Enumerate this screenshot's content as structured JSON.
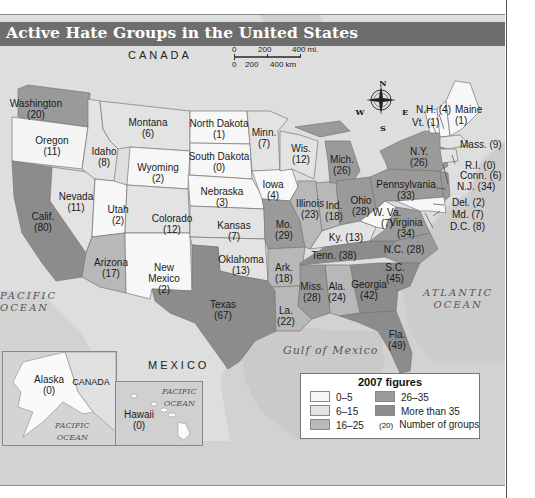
{
  "title": "Active Hate Groups in the United States",
  "scale": {
    "mi": [
      "0",
      "200",
      "400 mi."
    ],
    "km": [
      "0",
      "200",
      "400 km"
    ]
  },
  "compass": {
    "n": "N",
    "s": "S",
    "e": "E",
    "w": "W"
  },
  "labels": {
    "canada_top": "CANADA",
    "mexico": "MEXICO",
    "pacific_left": [
      "PACIFIC",
      "OCEAN"
    ],
    "atlantic": [
      "ATLANTIC",
      "OCEAN"
    ],
    "gulf": "Gulf of Mexico",
    "inset_canada": "CANADA",
    "inset_ak_pacific": [
      "PACIFIC",
      "OCEAN"
    ],
    "inset_hi_pacific": [
      "PACIFIC",
      "OCEAN"
    ]
  },
  "colors": {
    "c0_5": "#f7f7f7",
    "c6_15": "#e3e3e3",
    "c16_25": "#b8b8b8",
    "c26_35": "#9a9a9a",
    "c35plus": "#8c8c8c",
    "land": "#dcdcdc",
    "water": "#cfcfcf",
    "title_bar": "#6e6e6e"
  },
  "legend": {
    "title": "2007 figures",
    "items": [
      {
        "label": "0–5",
        "bin": "c0_5"
      },
      {
        "label": "6–15",
        "bin": "c6_15"
      },
      {
        "label": "16–25",
        "bin": "c16_25"
      },
      {
        "label": "26–35",
        "bin": "c26_35"
      },
      {
        "label": "More than 35",
        "bin": "c35plus"
      }
    ],
    "sample_count": "(20)",
    "sample_label": "Number of groups"
  },
  "chart_data": {
    "type": "choropleth",
    "title": "Active Hate Groups in the United States",
    "subtitle": "2007 figures",
    "legend_bins": [
      "0–5",
      "6–15",
      "16–25",
      "26–35",
      "More than 35"
    ],
    "states": [
      {
        "name": "Washington",
        "value": 20
      },
      {
        "name": "Oregon",
        "value": 11
      },
      {
        "name": "Idaho",
        "value": 8
      },
      {
        "name": "Montana",
        "value": 6
      },
      {
        "name": "Wyoming",
        "value": 2
      },
      {
        "name": "North Dakota",
        "value": 1
      },
      {
        "name": "South Dakota",
        "value": 0
      },
      {
        "name": "Nebraska",
        "value": 3
      },
      {
        "name": "Minn.",
        "value": 7
      },
      {
        "name": "Wis.",
        "value": 12
      },
      {
        "name": "Iowa",
        "value": 4
      },
      {
        "name": "Mich.",
        "value": 26
      },
      {
        "name": "Illinois",
        "value": 23
      },
      {
        "name": "Ind.",
        "value": 18
      },
      {
        "name": "Ohio",
        "value": 28
      },
      {
        "name": "N.Y.",
        "value": 26
      },
      {
        "name": "Pennsylvania",
        "value": 33
      },
      {
        "name": "Maine",
        "value": 1
      },
      {
        "name": "N.H.",
        "value": 4
      },
      {
        "name": "Vt.",
        "value": 1
      },
      {
        "name": "Mass.",
        "value": 9
      },
      {
        "name": "R.I.",
        "value": 0
      },
      {
        "name": "Conn.",
        "value": 6
      },
      {
        "name": "N.J.",
        "value": 34
      },
      {
        "name": "Del.",
        "value": 2
      },
      {
        "name": "Md.",
        "value": 7
      },
      {
        "name": "D.C.",
        "value": 8
      },
      {
        "name": "W. Va.",
        "value": 7
      },
      {
        "name": "Virginia",
        "value": 34
      },
      {
        "name": "Ky.",
        "value": 13
      },
      {
        "name": "Tenn.",
        "value": 38
      },
      {
        "name": "N.C.",
        "value": 28
      },
      {
        "name": "S.C.",
        "value": 45
      },
      {
        "name": "Georgia",
        "value": 42
      },
      {
        "name": "Ala.",
        "value": 24
      },
      {
        "name": "Miss.",
        "value": 28
      },
      {
        "name": "Fla.",
        "value": 49
      },
      {
        "name": "La.",
        "value": 22
      },
      {
        "name": "Ark.",
        "value": 18
      },
      {
        "name": "Mo.",
        "value": 29
      },
      {
        "name": "Kansas",
        "value": 7
      },
      {
        "name": "Oklahoma",
        "value": 13
      },
      {
        "name": "Texas",
        "value": 67
      },
      {
        "name": "New Mexico",
        "value": 2
      },
      {
        "name": "Colorado",
        "value": 12
      },
      {
        "name": "Utah",
        "value": 2
      },
      {
        "name": "Arizona",
        "value": 17
      },
      {
        "name": "Nevada",
        "value": 11
      },
      {
        "name": "Calif.",
        "value": 80
      },
      {
        "name": "Alaska",
        "value": 0
      },
      {
        "name": "Hawaii",
        "value": 0
      }
    ]
  },
  "state_labels": [
    {
      "id": "wa",
      "lines": [
        "Washington",
        "(20)"
      ],
      "x": 36,
      "y": 104
    },
    {
      "id": "or",
      "lines": [
        "Oregon",
        "(11)"
      ],
      "x": 52,
      "y": 141
    },
    {
      "id": "id",
      "lines": [
        "Idaho",
        "(8)"
      ],
      "x": 104,
      "y": 152
    },
    {
      "id": "mt",
      "lines": [
        "Montana",
        "(6)"
      ],
      "x": 148,
      "y": 123
    },
    {
      "id": "wy",
      "lines": [
        "Wyoming",
        "(2)"
      ],
      "x": 158,
      "y": 168
    },
    {
      "id": "nd",
      "lines": [
        "North Dakota",
        "(1)"
      ],
      "x": 219,
      "y": 124
    },
    {
      "id": "sd",
      "lines": [
        "South Dakota",
        "(0)"
      ],
      "x": 219,
      "y": 157
    },
    {
      "id": "ne",
      "lines": [
        "Nebraska",
        "(3)"
      ],
      "x": 222,
      "y": 192
    },
    {
      "id": "mn",
      "lines": [
        "Minn.",
        "(7)"
      ],
      "x": 264,
      "y": 133
    },
    {
      "id": "wi",
      "lines": [
        "Wis.",
        "(12)"
      ],
      "x": 301,
      "y": 149
    },
    {
      "id": "ia",
      "lines": [
        "Iowa",
        "(4)"
      ],
      "x": 273,
      "y": 185
    },
    {
      "id": "mi",
      "lines": [
        "Mich.",
        "(26)"
      ],
      "x": 342,
      "y": 160
    },
    {
      "id": "il",
      "lines": [
        "Illinois",
        "(23)"
      ],
      "x": 310,
      "y": 204
    },
    {
      "id": "in",
      "lines": [
        "Ind.",
        "(18)"
      ],
      "x": 334,
      "y": 206
    },
    {
      "id": "oh",
      "lines": [
        "Ohio",
        "(28)"
      ],
      "x": 361,
      "y": 201
    },
    {
      "id": "ny",
      "lines": [
        "N.Y.",
        "(26)"
      ],
      "x": 419,
      "y": 152
    },
    {
      "id": "pa",
      "lines": [
        "Pennsylvania",
        "(33)"
      ],
      "x": 406,
      "y": 185
    },
    {
      "id": "wv",
      "lines": [
        "W. Va.",
        "(7)"
      ],
      "x": 387,
      "y": 213
    },
    {
      "id": "va",
      "lines": [
        "Virginia",
        "(34)"
      ],
      "x": 406,
      "y": 223
    },
    {
      "id": "ky",
      "lines": [
        "Ky. (13)"
      ],
      "x": 346,
      "y": 238
    },
    {
      "id": "tn",
      "lines": [
        "Tenn. (38)"
      ],
      "x": 334,
      "y": 256
    },
    {
      "id": "nc",
      "lines": [
        "N.C. (28)"
      ],
      "x": 404,
      "y": 250
    },
    {
      "id": "sc",
      "lines": [
        "S.C.",
        "(45)"
      ],
      "x": 395,
      "y": 268
    },
    {
      "id": "ga",
      "lines": [
        "Georgia",
        "(42)"
      ],
      "x": 369,
      "y": 285
    },
    {
      "id": "al",
      "lines": [
        "Ala.",
        "(24)"
      ],
      "x": 337,
      "y": 287
    },
    {
      "id": "ms",
      "lines": [
        "Miss.",
        "(28)"
      ],
      "x": 312,
      "y": 287
    },
    {
      "id": "fl",
      "lines": [
        "Fla.",
        "(49)"
      ],
      "x": 397,
      "y": 335
    },
    {
      "id": "la",
      "lines": [
        "La.",
        "(22)"
      ],
      "x": 286,
      "y": 311
    },
    {
      "id": "ar",
      "lines": [
        "Ark.",
        "(18)"
      ],
      "x": 284,
      "y": 268
    },
    {
      "id": "mo",
      "lines": [
        "Mo.",
        "(29)"
      ],
      "x": 284,
      "y": 225
    },
    {
      "id": "ks",
      "lines": [
        "Kansas",
        "(7)"
      ],
      "x": 234,
      "y": 226
    },
    {
      "id": "ok",
      "lines": [
        "Oklahoma",
        "(13)"
      ],
      "x": 241,
      "y": 260
    },
    {
      "id": "tx",
      "lines": [
        "Texas",
        "(67)"
      ],
      "x": 223,
      "y": 305
    },
    {
      "id": "nm",
      "lines": [
        "New",
        "Mexico",
        "(2)"
      ],
      "x": 164,
      "y": 268
    },
    {
      "id": "co",
      "lines": [
        "Colorado",
        "(12)"
      ],
      "x": 172,
      "y": 219
    },
    {
      "id": "ut",
      "lines": [
        "Utah",
        "(2)"
      ],
      "x": 118,
      "y": 210
    },
    {
      "id": "az",
      "lines": [
        "Arizona",
        "(17)"
      ],
      "x": 111,
      "y": 263
    },
    {
      "id": "nv",
      "lines": [
        "Nevada",
        "(11)"
      ],
      "x": 76,
      "y": 197
    },
    {
      "id": "ca",
      "lines": [
        "Calif.",
        "(80)"
      ],
      "x": 43,
      "y": 217
    },
    {
      "id": "ak",
      "lines": [
        "Alaska",
        "(0)"
      ],
      "x": 49,
      "y": 380
    },
    {
      "id": "hi",
      "lines": [
        "Hawaii",
        "(0)"
      ],
      "x": 139,
      "y": 415
    }
  ],
  "ne_labels": [
    {
      "id": "nh",
      "text": "N.H. (4)",
      "x": 416,
      "y": 110
    },
    {
      "id": "vt",
      "text": "Vt. (1)",
      "x": 412,
      "y": 123
    },
    {
      "id": "me",
      "text": "Maine",
      "x": 455,
      "y": 110
    },
    {
      "id": "me2",
      "text": "(1)",
      "x": 455,
      "y": 121
    },
    {
      "id": "ma",
      "text": "Mass. (9)",
      "x": 460,
      "y": 145
    },
    {
      "id": "ri",
      "text": "R.I. (0)",
      "x": 465,
      "y": 166
    },
    {
      "id": "ct",
      "text": "Conn. (6)",
      "x": 460,
      "y": 176
    },
    {
      "id": "nj",
      "text": "N.J. (34)",
      "x": 457,
      "y": 187
    },
    {
      "id": "de",
      "text": "Del. (2)",
      "x": 452,
      "y": 203
    },
    {
      "id": "md",
      "text": "Md. (7)",
      "x": 452,
      "y": 215
    },
    {
      "id": "dc",
      "text": "D.C. (8)",
      "x": 450,
      "y": 227
    }
  ]
}
